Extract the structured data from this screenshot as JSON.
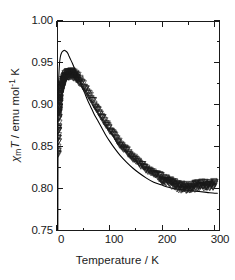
{
  "chart_data": {
    "type": "scatter",
    "title": "",
    "xlabel": "Temperature / K",
    "ylabel": "χm T / emu mol-1 K",
    "xlim": [
      0,
      310
    ],
    "ylim": [
      0.75,
      1.0
    ],
    "xticks": [
      0,
      100,
      200,
      300
    ],
    "xticks_minor": [
      50,
      150,
      250
    ],
    "yticks": [
      0.75,
      0.8,
      0.85,
      0.9,
      0.95,
      1.0
    ],
    "yticks_minor": [
      0.775,
      0.825,
      0.875,
      0.925,
      0.975
    ],
    "grid": false,
    "legend": false,
    "frame": "full-box-inward-ticks",
    "series": [
      {
        "name": "experimental data",
        "marker": "open-triangle-down",
        "marker_color": "#1a1a1a",
        "style": "markers",
        "x": [
          1.8,
          2.0,
          2.2,
          2.5,
          2.8,
          3.2,
          3.6,
          4.0,
          4.5,
          5.0,
          5.5,
          6.0,
          7.0,
          8.0,
          9.0,
          10.0,
          12.0,
          14.0,
          16.0,
          18.0,
          20.0,
          23.0,
          26.0,
          30.0,
          34.0,
          38.0,
          42.0,
          46.0,
          50.0,
          55.0,
          60.0,
          65.0,
          70.0,
          75.0,
          80.0,
          85.0,
          90.0,
          95.0,
          100.0,
          110.0,
          120.0,
          130.0,
          140.0,
          150.0,
          160.0,
          170.0,
          180.0,
          190.0,
          200.0,
          210.0,
          220.0,
          230.0,
          240.0,
          250.0,
          260.0,
          270.0,
          280.0,
          290.0,
          300.0
        ],
        "y": [
          0.841,
          0.848,
          0.855,
          0.864,
          0.872,
          0.88,
          0.887,
          0.893,
          0.899,
          0.904,
          0.908,
          0.911,
          0.916,
          0.92,
          0.923,
          0.925,
          0.929,
          0.932,
          0.934,
          0.935,
          0.936,
          0.937,
          0.937,
          0.937,
          0.935,
          0.933,
          0.93,
          0.927,
          0.923,
          0.918,
          0.913,
          0.908,
          0.902,
          0.897,
          0.891,
          0.886,
          0.881,
          0.876,
          0.871,
          0.862,
          0.854,
          0.847,
          0.84,
          0.834,
          0.829,
          0.824,
          0.82,
          0.816,
          0.812,
          0.809,
          0.806,
          0.803,
          0.802,
          0.802,
          0.803,
          0.804,
          0.805,
          0.805,
          0.806
        ]
      },
      {
        "name": "fit curve",
        "marker": "none",
        "line_color": "#000000",
        "style": "line",
        "x": [
          1.6,
          1.7,
          1.9,
          2.1,
          2.4,
          2.8,
          3.2,
          3.8,
          4.5,
          5.2,
          6.0,
          7.0,
          8.0,
          9.5,
          11.0,
          13.0,
          15.0,
          17.0,
          19.0,
          21.0,
          23.0,
          26.0,
          29.0,
          33.0,
          37.0,
          42.0,
          47.0,
          52.0,
          58.0,
          64.0,
          70.0,
          77.0,
          84.0,
          92.0,
          100.0,
          110.0,
          120.0,
          132.0,
          144.0,
          156.0,
          170.0,
          184.0,
          198.0,
          212.0,
          226.0,
          240.0,
          255.0,
          270.0,
          285.0,
          300.0,
          305.0
        ],
        "y": [
          0.75,
          0.79,
          0.845,
          0.884,
          0.906,
          0.92,
          0.93,
          0.939,
          0.947,
          0.952,
          0.956,
          0.959,
          0.961,
          0.963,
          0.964,
          0.965,
          0.965,
          0.964,
          0.963,
          0.961,
          0.958,
          0.954,
          0.95,
          0.944,
          0.938,
          0.93,
          0.922,
          0.915,
          0.906,
          0.898,
          0.89,
          0.882,
          0.874,
          0.865,
          0.857,
          0.848,
          0.84,
          0.832,
          0.825,
          0.819,
          0.813,
          0.808,
          0.805,
          0.802,
          0.8,
          0.799,
          0.798,
          0.797,
          0.796,
          0.795,
          0.795
        ]
      }
    ],
    "annotations": [
      "data points are open downward triangles forming a dense overlapping band",
      "fit curve peaks higher (0.965) than the data maximum (0.937)",
      "above ~235 K the measured data rise slightly while the fit keeps decreasing"
    ]
  },
  "axes": {
    "x_title": "Temperature / K",
    "y_title_chi": "χ",
    "y_title_sub": "m",
    "y_title_T": "T",
    "y_title_rest": " / emu mol",
    "y_title_sup": "-1",
    "y_title_tail": " K",
    "x_tick_labels": [
      "0",
      "100",
      "200",
      "300"
    ],
    "y_tick_labels": [
      "1.00",
      "0.95",
      "0.90",
      "0.85",
      "0.80",
      "0.75"
    ]
  },
  "colors": {
    "axis": "#1a1a1a",
    "data": "#1a1a1a",
    "fit": "#000000",
    "background": "#ffffff"
  }
}
